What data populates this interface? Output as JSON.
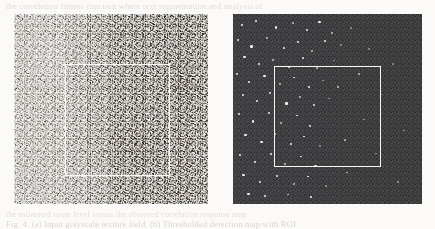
{
  "figure": {
    "caption_above": "the correlation fitness function where text segmentation and analysis of",
    "caption_below_line1": "the estimated noise level versus the observed correlation response map",
    "caption_below_line2": "Fig. 4. (a) Input grayscale texture field. (b) Thresholded detection map with ROI",
    "background_color": "#fbfaf8",
    "panels": [
      {
        "id": "panel-a",
        "name": "input-texture-panel",
        "label": "(a)",
        "kind": "grayscale-noise-image",
        "background_color": "#a8a6a2",
        "description": "Dense grainy grayscale speckle texture with a lighter vertical band on the left half and a darker band on the right half.",
        "band_boundary_fraction": 0.52,
        "roi": {
          "name": "region-of-interest-box",
          "stroke_color": "#faf9f6",
          "stroke_width_px": 1.5,
          "x_pct": 26.3,
          "y_pct": 26.3,
          "width_pct": 54.1,
          "height_pct": 58.9
        }
      },
      {
        "id": "panel-b",
        "name": "detection-map-panel",
        "label": "(b)",
        "kind": "thresholded-binary-detection-map",
        "background_color": "#3a3a3c",
        "speckle_color": "#f2f1ee",
        "description": "Dark uniform field sprinkled with bright white detection points, concentrated toward the left edge and sparse on the right.",
        "roi": {
          "name": "region-of-interest-box",
          "stroke_color": "#f6f5f2",
          "stroke_width_px": 1.5,
          "x_pct": 21.7,
          "y_pct": 27.4,
          "width_pct": 56.6,
          "height_pct": 53.2
        },
        "speckles": [
          {
            "x": 4.0,
            "y": 5.5,
            "w": 2.4,
            "h": 2.0,
            "t": "b"
          },
          {
            "x": 11.5,
            "y": 3.0,
            "w": 2.0,
            "h": 2.0,
            "t": "b"
          },
          {
            "x": 22.0,
            "y": 6.5,
            "w": 2.6,
            "h": 2.2,
            "t": "b"
          },
          {
            "x": 31.0,
            "y": 4.0,
            "w": 2.2,
            "h": 2.0,
            "t": "d"
          },
          {
            "x": 38.5,
            "y": 8.0,
            "w": 2.0,
            "h": 1.8,
            "t": "b"
          },
          {
            "x": 45.0,
            "y": 3.5,
            "w": 2.8,
            "h": 2.4,
            "t": "b"
          },
          {
            "x": 52.0,
            "y": 9.5,
            "w": 2.0,
            "h": 1.8,
            "t": "d"
          },
          {
            "x": 2.0,
            "y": 13.0,
            "w": 2.2,
            "h": 2.0,
            "t": "b"
          },
          {
            "x": 9.0,
            "y": 16.5,
            "w": 2.6,
            "h": 2.2,
            "t": "b"
          },
          {
            "x": 17.5,
            "y": 12.0,
            "w": 2.0,
            "h": 2.0,
            "t": "d"
          },
          {
            "x": 26.5,
            "y": 17.5,
            "w": 2.4,
            "h": 2.0,
            "t": "b"
          },
          {
            "x": 34.0,
            "y": 14.0,
            "w": 2.2,
            "h": 2.2,
            "t": "b"
          },
          {
            "x": 41.5,
            "y": 19.0,
            "w": 2.0,
            "h": 1.8,
            "t": "d"
          },
          {
            "x": 48.0,
            "y": 13.5,
            "w": 2.6,
            "h": 2.2,
            "t": "b"
          },
          {
            "x": 56.5,
            "y": 16.0,
            "w": 2.0,
            "h": 1.8,
            "t": "dd"
          },
          {
            "x": 5.5,
            "y": 22.0,
            "w": 2.8,
            "h": 2.4,
            "t": "b"
          },
          {
            "x": 13.0,
            "y": 26.0,
            "w": 2.2,
            "h": 2.0,
            "t": "b"
          },
          {
            "x": 20.5,
            "y": 23.5,
            "w": 2.0,
            "h": 2.0,
            "t": "d"
          },
          {
            "x": 29.0,
            "y": 27.5,
            "w": 2.6,
            "h": 2.2,
            "t": "b"
          },
          {
            "x": 36.5,
            "y": 22.5,
            "w": 2.0,
            "h": 1.8,
            "t": "b"
          },
          {
            "x": 44.0,
            "y": 28.0,
            "w": 2.2,
            "h": 2.0,
            "t": "d"
          },
          {
            "x": 53.0,
            "y": 24.0,
            "w": 2.0,
            "h": 1.8,
            "t": "dd"
          },
          {
            "x": 1.5,
            "y": 31.0,
            "w": 2.4,
            "h": 2.2,
            "t": "b"
          },
          {
            "x": 8.0,
            "y": 35.5,
            "w": 2.0,
            "h": 2.0,
            "t": "b"
          },
          {
            "x": 16.0,
            "y": 32.0,
            "w": 2.8,
            "h": 2.4,
            "t": "b"
          },
          {
            "x": 24.5,
            "y": 36.5,
            "w": 2.2,
            "h": 2.0,
            "t": "d"
          },
          {
            "x": 32.0,
            "y": 33.0,
            "w": 2.0,
            "h": 1.8,
            "t": "b"
          },
          {
            "x": 39.5,
            "y": 38.0,
            "w": 2.4,
            "h": 2.0,
            "t": "b"
          },
          {
            "x": 47.0,
            "y": 34.5,
            "w": 2.0,
            "h": 1.8,
            "t": "dd"
          },
          {
            "x": 4.5,
            "y": 42.0,
            "w": 2.6,
            "h": 2.2,
            "t": "b"
          },
          {
            "x": 12.0,
            "y": 45.5,
            "w": 2.2,
            "h": 2.0,
            "t": "b"
          },
          {
            "x": 19.0,
            "y": 41.0,
            "w": 2.0,
            "h": 2.0,
            "t": "b"
          },
          {
            "x": 27.5,
            "y": 46.5,
            "w": 2.8,
            "h": 2.4,
            "t": "b"
          },
          {
            "x": 35.0,
            "y": 43.0,
            "w": 2.2,
            "h": 2.0,
            "t": "d"
          },
          {
            "x": 42.5,
            "y": 47.5,
            "w": 2.0,
            "h": 1.8,
            "t": "b"
          },
          {
            "x": 50.0,
            "y": 44.0,
            "w": 2.0,
            "h": 1.8,
            "t": "dd"
          },
          {
            "x": 2.5,
            "y": 52.0,
            "w": 2.4,
            "h": 2.2,
            "t": "b"
          },
          {
            "x": 10.0,
            "y": 56.0,
            "w": 2.6,
            "h": 2.2,
            "t": "b"
          },
          {
            "x": 18.5,
            "y": 51.5,
            "w": 2.0,
            "h": 2.0,
            "t": "b"
          },
          {
            "x": 25.0,
            "y": 57.0,
            "w": 2.2,
            "h": 2.0,
            "t": "d"
          },
          {
            "x": 33.5,
            "y": 53.0,
            "w": 2.0,
            "h": 1.8,
            "t": "b"
          },
          {
            "x": 40.0,
            "y": 58.5,
            "w": 2.4,
            "h": 2.0,
            "t": "b"
          },
          {
            "x": 6.0,
            "y": 63.0,
            "w": 2.8,
            "h": 2.4,
            "t": "b"
          },
          {
            "x": 14.5,
            "y": 67.0,
            "w": 2.2,
            "h": 2.0,
            "t": "b"
          },
          {
            "x": 21.5,
            "y": 62.5,
            "w": 2.0,
            "h": 2.0,
            "t": "d"
          },
          {
            "x": 30.0,
            "y": 68.0,
            "w": 2.6,
            "h": 2.2,
            "t": "b"
          },
          {
            "x": 37.0,
            "y": 64.0,
            "w": 2.0,
            "h": 1.8,
            "t": "b"
          },
          {
            "x": 45.5,
            "y": 69.0,
            "w": 2.0,
            "h": 1.8,
            "t": "dd"
          },
          {
            "x": 3.0,
            "y": 73.5,
            "w": 2.4,
            "h": 2.2,
            "t": "b"
          },
          {
            "x": 11.0,
            "y": 77.5,
            "w": 2.6,
            "h": 2.2,
            "t": "b"
          },
          {
            "x": 19.5,
            "y": 73.0,
            "w": 2.0,
            "h": 2.0,
            "t": "b"
          },
          {
            "x": 27.0,
            "y": 78.5,
            "w": 2.2,
            "h": 2.0,
            "t": "d"
          },
          {
            "x": 35.5,
            "y": 74.5,
            "w": 2.0,
            "h": 1.8,
            "t": "b"
          },
          {
            "x": 43.0,
            "y": 79.5,
            "w": 2.4,
            "h": 2.0,
            "t": "b"
          },
          {
            "x": 5.0,
            "y": 84.0,
            "w": 2.8,
            "h": 2.4,
            "t": "b"
          },
          {
            "x": 13.5,
            "y": 88.0,
            "w": 2.2,
            "h": 2.0,
            "t": "b"
          },
          {
            "x": 22.5,
            "y": 84.5,
            "w": 2.0,
            "h": 2.0,
            "t": "b"
          },
          {
            "x": 31.5,
            "y": 89.0,
            "w": 2.6,
            "h": 2.2,
            "t": "d"
          },
          {
            "x": 39.0,
            "y": 85.0,
            "w": 2.0,
            "h": 1.8,
            "t": "b"
          },
          {
            "x": 48.5,
            "y": 90.0,
            "w": 2.0,
            "h": 1.8,
            "t": "dd"
          },
          {
            "x": 7.5,
            "y": 94.0,
            "w": 2.4,
            "h": 2.0,
            "t": "b"
          },
          {
            "x": 16.5,
            "y": 95.5,
            "w": 2.2,
            "h": 2.0,
            "t": "b"
          },
          {
            "x": 28.5,
            "y": 94.5,
            "w": 2.0,
            "h": 1.8,
            "t": "d"
          },
          {
            "x": 40.5,
            "y": 96.0,
            "w": 2.0,
            "h": 1.8,
            "t": "b"
          },
          {
            "x": 62.0,
            "y": 7.0,
            "w": 2.0,
            "h": 1.8,
            "t": "dd"
          },
          {
            "x": 71.5,
            "y": 18.0,
            "w": 1.8,
            "h": 1.6,
            "t": "dd"
          },
          {
            "x": 66.0,
            "y": 31.0,
            "w": 2.0,
            "h": 1.8,
            "t": "d"
          },
          {
            "x": 78.0,
            "y": 42.0,
            "w": 1.8,
            "h": 1.6,
            "t": "dd"
          },
          {
            "x": 69.0,
            "y": 55.0,
            "w": 2.0,
            "h": 1.8,
            "t": "dd"
          },
          {
            "x": 84.0,
            "y": 26.0,
            "w": 1.8,
            "h": 1.6,
            "t": "dd"
          },
          {
            "x": 90.0,
            "y": 61.0,
            "w": 1.8,
            "h": 1.6,
            "t": "dd"
          },
          {
            "x": 75.0,
            "y": 73.0,
            "w": 2.0,
            "h": 1.8,
            "t": "dd"
          },
          {
            "x": 60.0,
            "y": 83.0,
            "w": 2.0,
            "h": 1.8,
            "t": "d"
          },
          {
            "x": 87.0,
            "y": 88.0,
            "w": 1.8,
            "h": 1.6,
            "t": "dd"
          },
          {
            "x": 55.0,
            "y": 38.0,
            "w": 2.0,
            "h": 1.8,
            "t": "d"
          },
          {
            "x": 58.5,
            "y": 66.0,
            "w": 2.0,
            "h": 1.8,
            "t": "d"
          }
        ]
      }
    ]
  }
}
